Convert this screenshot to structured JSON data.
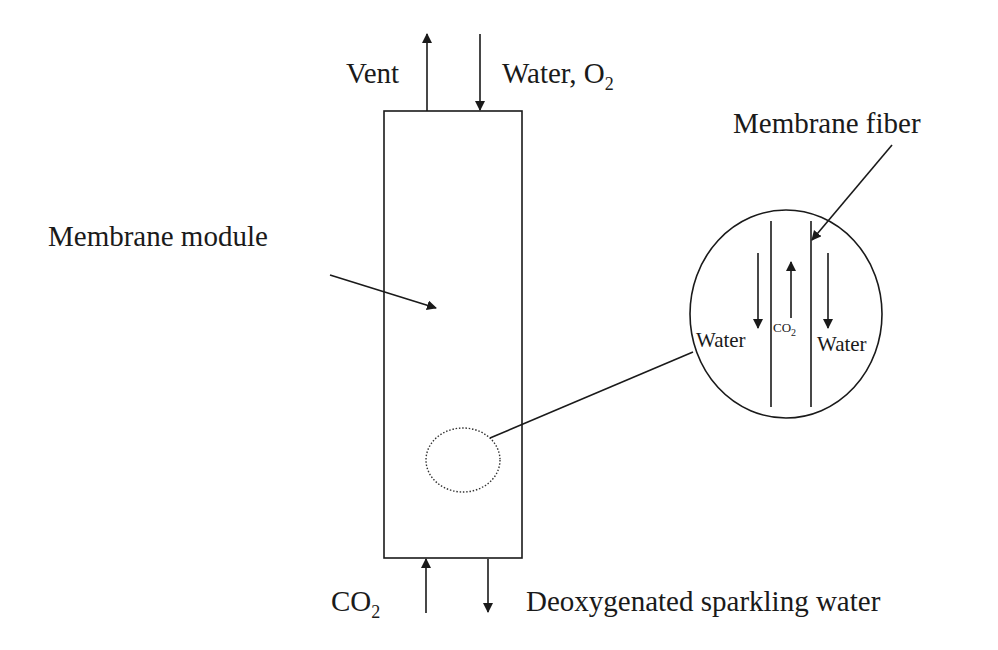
{
  "diagram": {
    "type": "process schematic",
    "labels": {
      "vent": "Vent",
      "inlet_main": "Water, O",
      "inlet_sub": "2",
      "module": "Membrane module",
      "fiber": "Membrane fiber",
      "co2_main": "CO",
      "co2_sub": "2",
      "outlet": "Deoxygenated sparkling water",
      "inset_water_left": "Water",
      "inset_water_right": "Water",
      "inset_co2_main": "CO",
      "inset_co2_sub": "2"
    },
    "nodes": [
      {
        "id": "module",
        "label": "Membrane module",
        "shape": "rectangle"
      },
      {
        "id": "detail",
        "label": "Membrane fiber detail",
        "shape": "circle"
      }
    ],
    "flows": [
      {
        "label": "Vent",
        "direction": "up",
        "from": "module top"
      },
      {
        "label": "Water, O2",
        "direction": "down",
        "into": "module top"
      },
      {
        "label": "CO2",
        "direction": "up",
        "into": "module bottom"
      },
      {
        "label": "Deoxygenated sparkling water",
        "direction": "down",
        "from": "module bottom"
      }
    ],
    "inset_flows": [
      {
        "label": "Water",
        "direction": "down",
        "side": "left"
      },
      {
        "label": "CO2",
        "direction": "up",
        "side": "center (inside fiber)"
      },
      {
        "label": "Water",
        "direction": "down",
        "side": "right"
      }
    ],
    "colors": {
      "line": "#1a1a1a",
      "background": "#ffffff"
    }
  }
}
